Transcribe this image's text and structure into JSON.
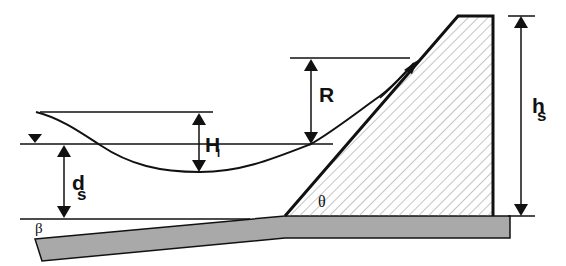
{
  "diagram": {
    "type": "wave run-up on sloped seawall schematic",
    "colors": {
      "line": "#111111",
      "base_fill": "#a9a9a9",
      "hatch": "#8a8a8a",
      "background": "#ffffff"
    },
    "labels": {
      "wave_height": "H",
      "wave_height_sub": "I",
      "runup": "R",
      "water_depth": "d",
      "water_depth_sub": "s",
      "structure_height": "h",
      "structure_height_sub": "s",
      "beach_slope_angle": "β",
      "structure_slope_angle": "θ"
    },
    "symbols": {
      "still_water_level": "still-water-level-marker (inverted triangle)"
    }
  }
}
